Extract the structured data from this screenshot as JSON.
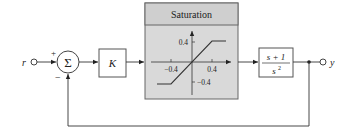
{
  "diagram": {
    "type": "feedback control block diagram",
    "input_label": "r",
    "output_label": "y",
    "summing_junction": {
      "symbol": "Σ",
      "plus_sign": "+",
      "minus_sign": "−"
    },
    "gain_block": {
      "label": "K"
    },
    "saturation_block": {
      "title": "Saturation",
      "y_tick_pos": "0.4",
      "y_tick_neg": "−0.4",
      "x_tick_pos": "0.4",
      "x_tick_neg": "−0.4",
      "fill_color": "#d9d9d9",
      "title_fill_color": "#cfcfcf"
    },
    "plant_block": {
      "numerator": "s + 1",
      "denominator": "s",
      "denominator_exponent": "2"
    }
  }
}
